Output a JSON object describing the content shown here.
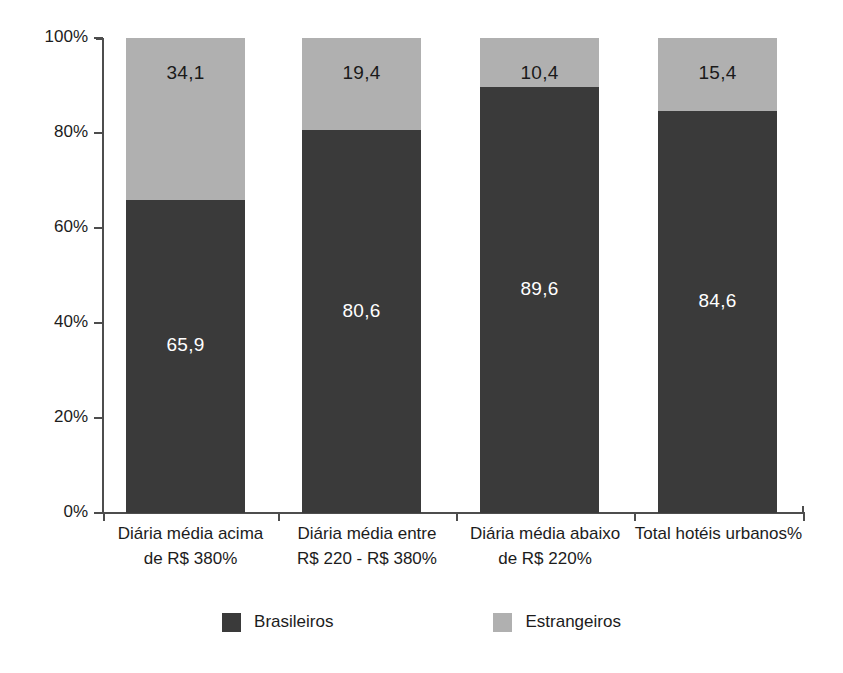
{
  "chart_data": {
    "type": "bar",
    "subtype": "stacked-100-percent",
    "title": "",
    "subtitle": "",
    "xlabel": "",
    "ylabel": "",
    "ylim": [
      0,
      100
    ],
    "ytick_values": [
      0,
      20,
      40,
      60,
      80,
      100
    ],
    "ytick_labels": [
      "0%",
      "20%",
      "40%",
      "60%",
      "80%",
      "100%"
    ],
    "grid": false,
    "legend_position": "bottom",
    "categories": [
      "Diária média acima de R$ 380%",
      "Diária média entre R$ 220 - R$ 380%",
      "Diária média abaixo de R$ 220%",
      "Total hotéis urbanos%"
    ],
    "category_lines": [
      [
        "Diária média acima",
        "de R$ 380%"
      ],
      [
        "Diária média entre",
        "R$ 220 - R$ 380%"
      ],
      [
        "Diária média abaixo",
        "de R$ 220%"
      ],
      [
        "Total hotéis urbanos%",
        ""
      ]
    ],
    "series": [
      {
        "name": "Brasileiros",
        "color": "#3a3a3a",
        "values": [
          65.9,
          80.6,
          89.6,
          84.6
        ],
        "labels": [
          "65,9",
          "80,6",
          "89,6",
          "84,6"
        ]
      },
      {
        "name": "Estrangeiros",
        "color": "#b0b0b0",
        "values": [
          34.1,
          19.4,
          10.4,
          15.4
        ],
        "labels": [
          "34,1",
          "19,4",
          "10,4",
          "15,4"
        ]
      }
    ]
  },
  "axis": {
    "y": {
      "ticks": [
        {
          "label": "100%",
          "value": 100
        },
        {
          "label": "80%",
          "value": 80
        },
        {
          "label": "60%",
          "value": 60
        },
        {
          "label": "40%",
          "value": 40
        },
        {
          "label": "20%",
          "value": 20
        },
        {
          "label": "0%",
          "value": 0
        }
      ]
    }
  },
  "legend": {
    "items": [
      {
        "label": "Brasileiros",
        "color": "#3a3a3a"
      },
      {
        "label": "Estrangeiros",
        "color": "#b0b0b0"
      }
    ]
  },
  "colors": {
    "series_dark": "#3a3a3a",
    "series_light": "#b0b0b0",
    "axis": "#4d4d4d",
    "text": "#1c1c1c",
    "background": "#ffffff",
    "label_on_dark": "#ffffff"
  }
}
